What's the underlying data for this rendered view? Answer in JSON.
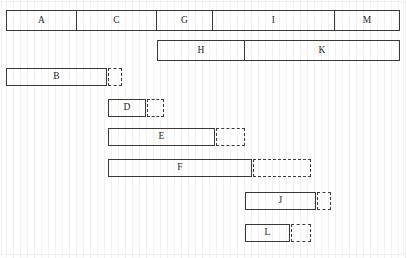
{
  "chart_data": {
    "type": "bar",
    "title": "",
    "subtitle": "",
    "xlabel": "",
    "ylabel": "",
    "orientation": "horizontal",
    "grid": true,
    "grid_orientation": "vertical",
    "legend": "none",
    "xlim": [
      0,
      407
    ],
    "ylim": [
      0,
      258
    ],
    "units": "pixels",
    "rows": [
      {
        "row": 1,
        "y": 10,
        "height": 21,
        "kind": "segmented",
        "start": 6,
        "end": 400,
        "segments": [
          {
            "label": "A",
            "start": 6,
            "end": 77
          },
          {
            "label": "C",
            "start": 77,
            "end": 157
          },
          {
            "label": "G",
            "start": 157,
            "end": 213
          },
          {
            "label": "I",
            "start": 213,
            "end": 335
          },
          {
            "label": "M",
            "start": 335,
            "end": 400
          }
        ],
        "slack": null
      },
      {
        "row": 2,
        "y": 40,
        "height": 21,
        "kind": "segmented",
        "start": 157,
        "end": 400,
        "segments": [
          {
            "label": "H",
            "start": 157,
            "end": 245
          },
          {
            "label": "K",
            "start": 245,
            "end": 400
          }
        ],
        "slack": null
      },
      {
        "row": 3,
        "y": 68,
        "height": 18,
        "kind": "single",
        "label": "B",
        "start": 6,
        "end": 107,
        "slack": {
          "start": 108,
          "end": 122
        }
      },
      {
        "row": 4,
        "y": 99,
        "height": 18,
        "kind": "single",
        "label": "D",
        "start": 108,
        "end": 146,
        "slack": {
          "start": 147,
          "end": 164
        }
      },
      {
        "row": 5,
        "y": 128,
        "height": 18,
        "kind": "single",
        "label": "E",
        "start": 108,
        "end": 215,
        "slack": {
          "start": 216,
          "end": 245
        }
      },
      {
        "row": 6,
        "y": 159,
        "height": 18,
        "kind": "single",
        "label": "F",
        "start": 108,
        "end": 252,
        "slack": {
          "start": 253,
          "end": 311
        }
      },
      {
        "row": 7,
        "y": 192,
        "height": 18,
        "kind": "single",
        "label": "J",
        "start": 245,
        "end": 316,
        "slack": {
          "start": 317,
          "end": 331
        }
      },
      {
        "row": 8,
        "y": 224,
        "height": 18,
        "kind": "single",
        "label": "L",
        "start": 245,
        "end": 290,
        "slack": {
          "start": 291,
          "end": 311
        }
      }
    ],
    "labels": [
      "A",
      "C",
      "G",
      "I",
      "M",
      "H",
      "K",
      "B",
      "D",
      "E",
      "F",
      "J",
      "L"
    ],
    "colors": {
      "bar_outline": "#3a3a3a",
      "bar_fill": "#ffffff",
      "slack_outline": "#3a3a3a",
      "grid_line": "#f1f1f1",
      "frame": "#efefef",
      "text": "#262626",
      "background": "#ffffff"
    }
  }
}
